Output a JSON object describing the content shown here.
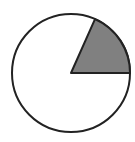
{
  "chart_data": {
    "type": "pie",
    "title": "",
    "slices": [
      {
        "label": "shaded",
        "angle_deg": 66,
        "fraction": 0.183,
        "color": "#808080"
      },
      {
        "label": "unshaded",
        "angle_deg": 294,
        "fraction": 0.817,
        "color": "#ffffff"
      }
    ],
    "start_angle_deg": 0,
    "direction": "counterclockwise",
    "outline_color": "#222222",
    "legend": []
  },
  "geometry": {
    "cx": 71,
    "cy": 73,
    "r": 59
  }
}
